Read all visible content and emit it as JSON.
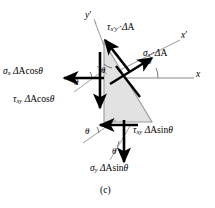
{
  "figure": {
    "caption": "(c)",
    "background_color": "#ffffff",
    "wedge_fill_color": "#e2e2e2",
    "wedge_stroke_color": "#9a9a9a",
    "force_arrow_color": "#000000",
    "axis_line_color": "#8c8c8c"
  },
  "axes": [
    {
      "name": "y-prime-axis",
      "label_sigma": "y",
      "label_prime": "′",
      "x": 88,
      "y": 12
    },
    {
      "name": "x-prime-axis",
      "label_sigma": "x",
      "label_prime": "′",
      "x": 183,
      "y": 33
    },
    {
      "name": "x-axis",
      "label_sigma": "x",
      "label_prime": "",
      "x": 198,
      "y": 72
    }
  ],
  "angles": [
    {
      "name": "theta-wedge-interior",
      "label": "θ",
      "x": 103,
      "y": 72
    },
    {
      "name": "theta-left-upper",
      "label": "θ",
      "x": 76,
      "y": 84
    },
    {
      "name": "theta-right-xprime",
      "label": "θ",
      "x": 148,
      "y": 62
    },
    {
      "name": "theta-bottom-left",
      "label": "θ",
      "x": 87,
      "y": 132
    },
    {
      "name": "theta-bottom-right",
      "label": "θ",
      "x": 113,
      "y": 152
    }
  ],
  "forces": [
    {
      "name": "tau-xprime-yprime-deltaA",
      "symbol": "τ",
      "subscript": "x′y′",
      "magnitude": "ΔA",
      "full_label": "τx′y′ ΔA",
      "label_x": 110,
      "label_y": 28,
      "direction": "up-left along inclined face"
    },
    {
      "name": "sigma-xprime-deltaA",
      "symbol": "σ",
      "subscript": "x′",
      "magnitude": "ΔA",
      "full_label": "σx′ ΔA",
      "label_x": 146,
      "label_y": 54,
      "direction": "up-right normal to inclined face"
    },
    {
      "name": "sigma-x-deltaA-cos-theta",
      "symbol": "σ",
      "subscript": "x",
      "magnitude": "ΔA cosθ",
      "full_label": "σx ΔA cosθ",
      "label_x": 6,
      "label_y": 71,
      "direction": "left along negative x"
    },
    {
      "name": "tau-xy-deltaA-cos-theta",
      "symbol": "τ",
      "subscript": "xy",
      "magnitude": "ΔA cosθ",
      "full_label": "τxy ΔA cosθ",
      "label_x": 16,
      "label_y": 99,
      "direction": "down along negative y"
    },
    {
      "name": "tau-xy-deltaA-sin-theta",
      "symbol": "τ",
      "subscript": "xy",
      "magnitude": "ΔA sinθ",
      "full_label": "τxy ΔA sinθ",
      "label_x": 136,
      "label_y": 130,
      "direction": "left along negative x at bottom face"
    },
    {
      "name": "sigma-y-deltaA-sin-theta",
      "symbol": "σ",
      "subscript": "y",
      "magnitude": "ΔA sinθ",
      "full_label": "σy ΔA sinθ",
      "label_x": 93,
      "label_y": 167,
      "direction": "down along negative y at bottom face"
    }
  ],
  "symbols": {
    "delta": "Δ",
    "theta": "θ",
    "sigma": "σ",
    "tau": "τ",
    "prime": "′",
    "cos": "cos",
    "sin": "sin",
    "A": "A"
  }
}
